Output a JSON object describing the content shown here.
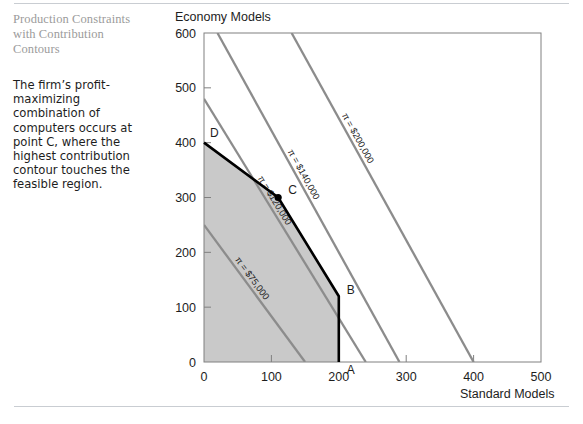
{
  "caption": {
    "title": "Production Constraints with Contribution Contours",
    "body": "The firm’s profit-maximizing combination of computers occurs at point C, where the highest contribution contour touches the feasible region."
  },
  "chart_data": {
    "type": "line",
    "title": "Economy Models",
    "xlabel": "Standard Models",
    "ylabel": "Economy Models",
    "xlim": [
      0,
      500
    ],
    "ylim": [
      0,
      600
    ],
    "xticks": [
      0,
      100,
      200,
      300,
      400,
      500
    ],
    "yticks": [
      0,
      100,
      200,
      300,
      400,
      500,
      600
    ],
    "grid": false,
    "legend": "none",
    "feasible_region": {
      "name": "feasible region",
      "fill": "#c9c9c9",
      "vertices": [
        {
          "label": "origin",
          "x": 0,
          "y": 0
        },
        {
          "label": "D",
          "x": 0,
          "y": 400
        },
        {
          "label": "C",
          "x": 110,
          "y": 300
        },
        {
          "label": "B",
          "x": 200,
          "y": 120
        },
        {
          "label": "A",
          "x": 200,
          "y": 0
        }
      ]
    },
    "vertex_labels": [
      {
        "label": "D",
        "x": 0,
        "y": 400
      },
      {
        "label": "C",
        "x": 110,
        "y": 300,
        "marker": true
      },
      {
        "label": "B",
        "x": 200,
        "y": 120
      },
      {
        "label": "A",
        "x": 200,
        "y": 0
      }
    ],
    "series": [
      {
        "name": "π = $75,000",
        "value": 75000,
        "color": "#8c8c8c",
        "points": [
          {
            "x": 0,
            "y": 250
          },
          {
            "x": 150,
            "y": 0
          }
        ]
      },
      {
        "name": "π = $120,000",
        "value": 120000,
        "color": "#8c8c8c",
        "points": [
          {
            "x": 0,
            "y": 480
          },
          {
            "x": 240,
            "y": 0
          }
        ]
      },
      {
        "name": "π = $140,000",
        "value": 140000,
        "color": "#8c8c8c",
        "points": [
          {
            "x": 20,
            "y": 600
          },
          {
            "x": 290,
            "y": 0
          }
        ]
      },
      {
        "name": "π = $200,000",
        "value": 200000,
        "color": "#8c8c8c",
        "points": [
          {
            "x": 130,
            "y": 600
          },
          {
            "x": 400,
            "y": 0
          }
        ]
      }
    ],
    "constraint_boundary": {
      "name": "constraint frontier",
      "color": "#000000",
      "points": [
        {
          "x": 0,
          "y": 400
        },
        {
          "x": 110,
          "y": 300
        },
        {
          "x": 200,
          "y": 120
        },
        {
          "x": 200,
          "y": 0
        }
      ]
    }
  }
}
